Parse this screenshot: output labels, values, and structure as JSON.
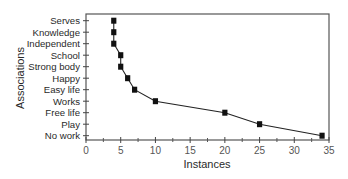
{
  "chart_data": {
    "type": "line",
    "title": "",
    "xlabel": "Instances",
    "ylabel": "Associations",
    "xlim": [
      0,
      35
    ],
    "x_ticks": [
      0,
      5,
      10,
      15,
      20,
      25,
      30,
      35
    ],
    "x_minor_ticks": [
      2.5,
      7.5,
      12.5,
      17.5,
      22.5,
      27.5,
      32.5
    ],
    "categories": [
      "Serves",
      "Knowledge",
      "Independent",
      "School",
      "Strong body",
      "Happy",
      "Easy life",
      "Works",
      "Free life",
      "Play",
      "No work"
    ],
    "values": [
      4,
      4,
      4,
      5,
      5,
      6,
      7,
      10,
      20,
      25,
      34
    ],
    "marker": "square",
    "grid": false,
    "legend": null,
    "colors": {
      "line": "#222222",
      "marker": "#111111",
      "frame": "#555555"
    }
  }
}
